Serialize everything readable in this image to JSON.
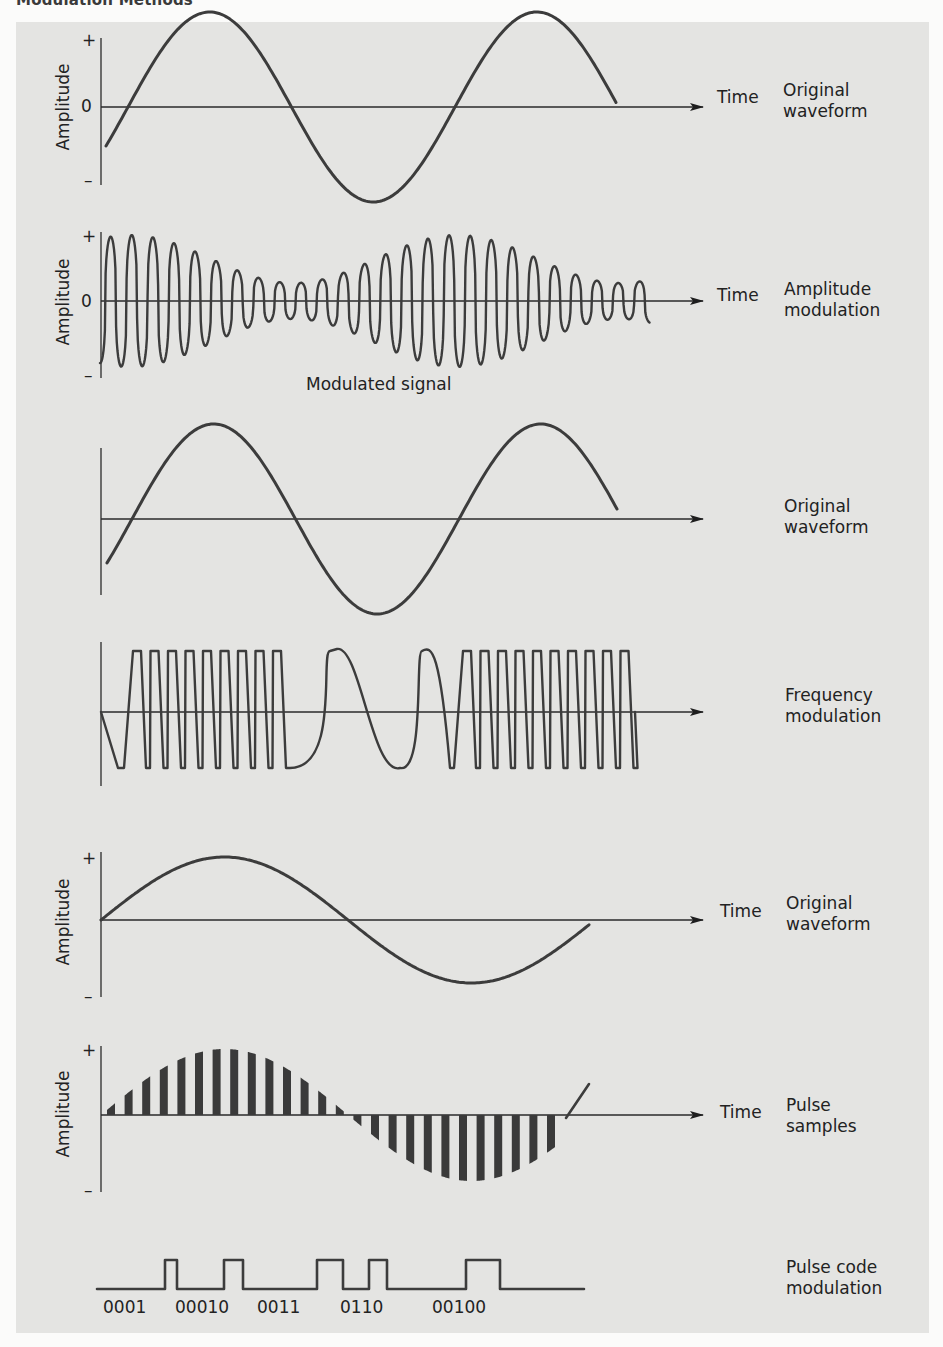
{
  "header": {
    "title": "Modulation Methods"
  },
  "colors": {
    "panel_bg": "#e4e4e2",
    "stroke": "#3c3c3c",
    "axis": "#2a2a2a",
    "text": "#222222"
  },
  "axis": {
    "amplitude_label": "Amplitude",
    "plus": "+",
    "zero": "0",
    "minus": "–",
    "time_label": "Time"
  },
  "sections": [
    {
      "id": "am-original",
      "label_line1": "Original",
      "label_line2": "waveform",
      "has_time": true,
      "has_amplitude": true,
      "has_zero": true
    },
    {
      "id": "am-modulated",
      "label_line1": "Amplitude",
      "label_line2": "modulation",
      "has_time": true,
      "has_amplitude": true,
      "has_zero": true,
      "caption": "Modulated signal"
    },
    {
      "id": "fm-original",
      "label_line1": "Original",
      "label_line2": "waveform",
      "has_time": false,
      "has_amplitude": false
    },
    {
      "id": "fm-modulated",
      "label_line1": "Frequency",
      "label_line2": "modulation",
      "has_time": false,
      "has_amplitude": false
    },
    {
      "id": "pcm-original",
      "label_line1": "Original",
      "label_line2": "waveform",
      "has_time": true,
      "has_amplitude": true,
      "has_zero": false
    },
    {
      "id": "pcm-samples",
      "label_line1": "Pulse",
      "label_line2": "samples",
      "has_time": true,
      "has_amplitude": true,
      "has_zero": false
    },
    {
      "id": "pcm-code",
      "label_line1": "Pulse code",
      "label_line2": "modulation",
      "has_time": false,
      "has_amplitude": false
    }
  ],
  "pcm_codes": [
    "0001",
    "00010",
    "0011",
    "0110",
    "00100"
  ],
  "chart_data": [
    {
      "type": "line",
      "title": "Original waveform (AM)",
      "xlabel": "Time",
      "ylabel": "Amplitude",
      "yticks": [
        "+",
        "0",
        "–"
      ],
      "description": "Sine wave, ~1.75 cycles"
    },
    {
      "type": "line",
      "title": "Amplitude modulation",
      "xlabel": "Time",
      "ylabel": "Amplitude",
      "yticks": [
        "+",
        "0",
        "–"
      ],
      "carrier_cycles": 26,
      "description": "Carrier whose envelope follows original waveform",
      "caption": "Modulated signal"
    },
    {
      "type": "line",
      "title": "Original waveform (FM)",
      "description": "Sine wave, ~1.75 cycles"
    },
    {
      "type": "line",
      "title": "Frequency modulation",
      "description": "Constant amplitude carrier; dense cycles at high signal, sparse at low signal"
    },
    {
      "type": "line",
      "title": "Original waveform (PCM)",
      "xlabel": "Time",
      "ylabel": "Amplitude",
      "yticks": [
        "+",
        "–"
      ],
      "description": "Sine wave, ~1.1 cycles"
    },
    {
      "type": "bar",
      "title": "Pulse samples",
      "xlabel": "Time",
      "ylabel": "Amplitude",
      "yticks": [
        "+",
        "–"
      ],
      "sample_count": 26,
      "description": "Regular samples of the original waveform"
    },
    {
      "type": "line",
      "title": "Pulse code modulation",
      "categories": [
        "0001",
        "00010",
        "0011",
        "0110",
        "00100"
      ],
      "description": "Binary pulse train encoding samples"
    }
  ]
}
